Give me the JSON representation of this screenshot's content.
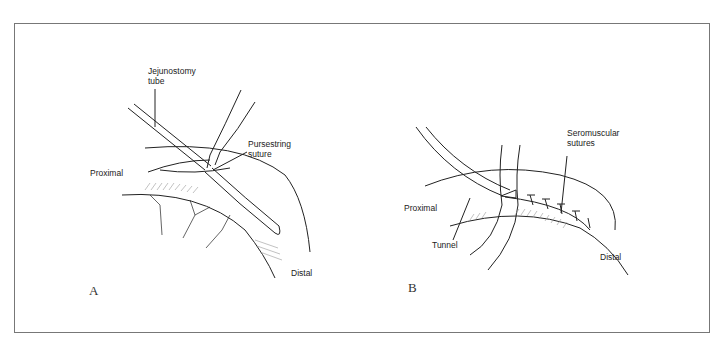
{
  "figure": {
    "panel_a": {
      "letter": "A",
      "labels": {
        "tube_line1": "Jejunostomy",
        "tube_line2": "tube",
        "suture_line1": "Pursestring",
        "suture_line2": "suture",
        "proximal": "Proximal",
        "distal": "Distal"
      }
    },
    "panel_b": {
      "letter": "B",
      "labels": {
        "sero_line1": "Seromuscular",
        "sero_line2": "sutures",
        "proximal": "Proximal",
        "tunnel": "Tunnel",
        "distal": "Distal"
      }
    },
    "colors": {
      "line": "#222222",
      "frame": "#777777",
      "shading": "#999999"
    }
  }
}
